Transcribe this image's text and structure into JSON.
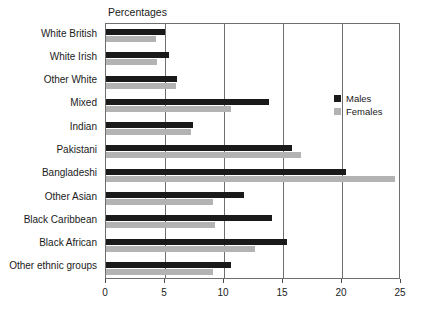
{
  "chart_data": {
    "type": "bar",
    "orientation": "horizontal",
    "title": "Percentages",
    "xlabel": "",
    "ylabel": "",
    "xlim": [
      0,
      25
    ],
    "xticks": [
      0,
      5,
      10,
      15,
      20,
      25
    ],
    "xtick_labels": [
      "0",
      "5",
      "10",
      "15",
      "20",
      "25"
    ],
    "grid": true,
    "grid_axis": "x",
    "legend_position": "right-inside",
    "categories": [
      "White British",
      "White Irish",
      "Other White",
      "Mixed",
      "Indian",
      "Pakistani",
      "Bangladeshi",
      "Other Asian",
      "Black Caribbean",
      "Black African",
      "Other ethnic groups"
    ],
    "series": [
      {
        "name": "Males",
        "color": "#1a1a1a",
        "values": [
          5.0,
          5.3,
          6.0,
          13.8,
          7.4,
          15.8,
          20.3,
          11.7,
          14.1,
          15.3,
          10.6
        ]
      },
      {
        "name": "Females",
        "color": "#b3b3b3",
        "values": [
          4.2,
          4.3,
          5.9,
          10.6,
          7.2,
          16.5,
          24.5,
          9.1,
          9.2,
          12.6,
          9.1
        ]
      }
    ]
  },
  "legend": {
    "items": [
      {
        "label": "Males",
        "color": "#1a1a1a"
      },
      {
        "label": "Females",
        "color": "#b3b3b3"
      }
    ]
  }
}
